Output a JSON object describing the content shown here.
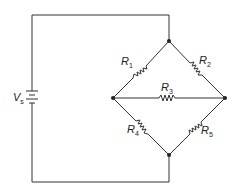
{
  "diagram": {
    "type": "circuit-schematic",
    "source": {
      "symbol": "V",
      "subscript": "s"
    },
    "resistors": [
      {
        "id": "R1",
        "symbol": "R",
        "subscript": "1",
        "branch": "left-node to top-node"
      },
      {
        "id": "R2",
        "symbol": "R",
        "subscript": "2",
        "branch": "top-node to right-node"
      },
      {
        "id": "R3",
        "symbol": "R",
        "subscript": "3",
        "branch": "left-node to right-node"
      },
      {
        "id": "R4",
        "symbol": "R",
        "subscript": "4",
        "branch": "left-node to bottom-node"
      },
      {
        "id": "R5",
        "symbol": "R",
        "subscript": "5",
        "branch": "bottom-node to right-node"
      }
    ],
    "nodes": [
      "top",
      "left",
      "right",
      "bottom"
    ],
    "colors": {
      "wire": "#333333",
      "background": "#ffffff"
    }
  }
}
